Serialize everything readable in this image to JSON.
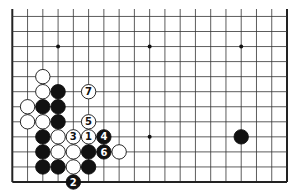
{
  "board": {
    "size": 19,
    "visible_rows": [
      1,
      12
    ],
    "visible_cols": [
      1,
      19
    ],
    "star_points": [
      {
        "col": 4,
        "row": 10
      },
      {
        "col": 10,
        "row": 10
      },
      {
        "col": 16,
        "row": 10
      },
      {
        "col": 4,
        "row": 4
      },
      {
        "col": 10,
        "row": 4
      },
      {
        "col": 16,
        "row": 4
      }
    ],
    "colors": {
      "black": "#111111",
      "white": "#ffffff",
      "line": "#333333",
      "edge": "#222222"
    }
  },
  "stones": [
    {
      "col": 3,
      "row": 8,
      "color": "white",
      "label": ""
    },
    {
      "col": 3,
      "row": 7,
      "color": "white",
      "label": ""
    },
    {
      "col": 4,
      "row": 7,
      "color": "black",
      "label": ""
    },
    {
      "col": 6,
      "row": 7,
      "color": "white",
      "label": "7"
    },
    {
      "col": 2,
      "row": 6,
      "color": "white",
      "label": ""
    },
    {
      "col": 3,
      "row": 6,
      "color": "black",
      "label": ""
    },
    {
      "col": 4,
      "row": 6,
      "color": "black",
      "label": ""
    },
    {
      "col": 2,
      "row": 5,
      "color": "white",
      "label": ""
    },
    {
      "col": 3,
      "row": 5,
      "color": "white",
      "label": ""
    },
    {
      "col": 4,
      "row": 5,
      "color": "black",
      "label": ""
    },
    {
      "col": 6,
      "row": 5,
      "color": "white",
      "label": "5"
    },
    {
      "col": 3,
      "row": 4,
      "color": "black",
      "label": ""
    },
    {
      "col": 4,
      "row": 4,
      "color": "white",
      "label": ""
    },
    {
      "col": 5,
      "row": 4,
      "color": "white",
      "label": "3"
    },
    {
      "col": 6,
      "row": 4,
      "color": "white",
      "label": "1"
    },
    {
      "col": 7,
      "row": 4,
      "color": "black",
      "label": "4"
    },
    {
      "col": 3,
      "row": 3,
      "color": "black",
      "label": ""
    },
    {
      "col": 4,
      "row": 3,
      "color": "white",
      "label": ""
    },
    {
      "col": 5,
      "row": 3,
      "color": "white",
      "label": ""
    },
    {
      "col": 6,
      "row": 3,
      "color": "black",
      "label": ""
    },
    {
      "col": 7,
      "row": 3,
      "color": "black",
      "label": "6"
    },
    {
      "col": 8,
      "row": 3,
      "color": "white",
      "label": ""
    },
    {
      "col": 3,
      "row": 2,
      "color": "black",
      "label": ""
    },
    {
      "col": 4,
      "row": 2,
      "color": "black",
      "label": ""
    },
    {
      "col": 5,
      "row": 2,
      "color": "white",
      "label": ""
    },
    {
      "col": 6,
      "row": 2,
      "color": "black",
      "label": ""
    },
    {
      "col": 5,
      "row": 1,
      "color": "black",
      "label": "2"
    },
    {
      "col": 16,
      "row": 4,
      "color": "black",
      "label": ""
    }
  ]
}
